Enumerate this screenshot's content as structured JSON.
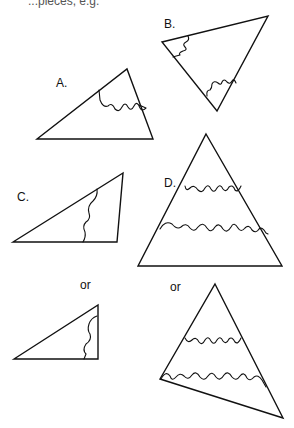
{
  "header_fragment": "...pieces, e.g.",
  "figures": [
    {
      "id": "A",
      "label": "A."
    },
    {
      "id": "B",
      "label": "B."
    },
    {
      "id": "C",
      "label": "C."
    },
    {
      "id": "D",
      "label": "D."
    }
  ],
  "alternatives": [
    {
      "id": "C-alt",
      "label": "or"
    },
    {
      "id": "D-alt",
      "label": "or"
    }
  ],
  "colors": {
    "stroke": "#111111",
    "background": "#ffffff"
  }
}
